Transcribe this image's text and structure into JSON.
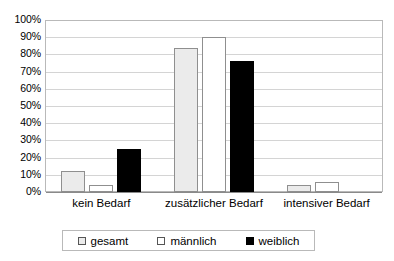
{
  "chart_data": {
    "type": "bar",
    "title": "",
    "subtitle": "",
    "xlabel": "",
    "ylabel": "",
    "ylim": [
      0,
      100
    ],
    "yticks": [
      "0%",
      "10%",
      "20%",
      "30%",
      "40%",
      "50%",
      "60%",
      "70%",
      "80%",
      "90%",
      "100%"
    ],
    "ytick_values": [
      0,
      10,
      20,
      30,
      40,
      50,
      60,
      70,
      80,
      90,
      100
    ],
    "grid": true,
    "legend_position": "bottom",
    "orientation": "vertical",
    "categories": [
      "kein Bedarf",
      "zusätzlicher Bedarf",
      "intensiver Bedarf"
    ],
    "series": [
      {
        "name": "gesamt",
        "color": "#ebebeb",
        "border_color": "#8f8f8f",
        "values": [
          12,
          84,
          4
        ]
      },
      {
        "name": "männlich",
        "color": "#ffffff",
        "border_color": "#8f8f8f",
        "values": [
          4,
          90,
          6
        ]
      },
      {
        "name": "weiblich",
        "color": "#000000",
        "border_color": "#000000",
        "values": [
          25,
          76,
          0
        ]
      }
    ]
  },
  "legend": {
    "items": [
      {
        "label": "gesamt",
        "swatch": "legend-swatch-gesamt"
      },
      {
        "label": "männlich",
        "swatch": "legend-swatch-maennlich"
      },
      {
        "label": "weiblich",
        "swatch": "legend-swatch-weiblich"
      }
    ]
  },
  "axes": {
    "y_tick_labels": [
      "100%",
      "90%",
      "80%",
      "70%",
      "60%",
      "50%",
      "40%",
      "30%",
      "20%",
      "10%",
      "0%"
    ]
  }
}
